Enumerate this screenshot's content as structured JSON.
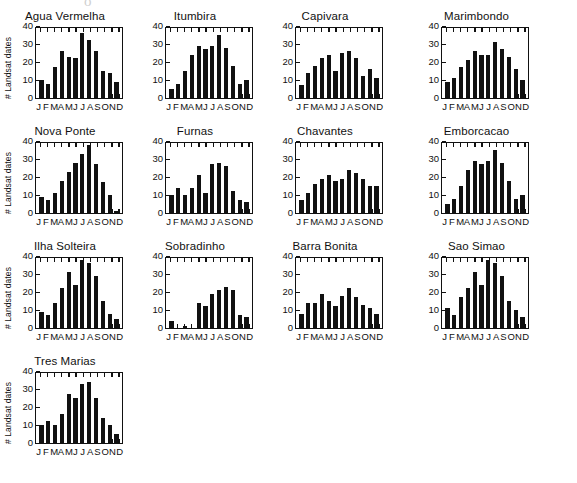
{
  "figure": {
    "ghost_glyph": "o",
    "ylabel": "# Landsat dates",
    "months": [
      "J",
      "F",
      "M",
      "A",
      "M",
      "J",
      "J",
      "A",
      "S",
      "O",
      "N",
      "D"
    ],
    "yticks": [
      0,
      10,
      20,
      30,
      40
    ]
  },
  "chart_data": {
    "type": "bar",
    "title": "",
    "xlabel": "",
    "ylabel": "# Landsat dates",
    "ylim": [
      0,
      40
    ],
    "grid": false,
    "legend": "none",
    "layout": "small-multiples, 4 columns x 4 rows (13 panels)",
    "categories": [
      "J",
      "F",
      "M",
      "A",
      "M",
      "J",
      "J",
      "A",
      "S",
      "O",
      "N",
      "D"
    ],
    "tick_labels_y": [
      "0",
      "10",
      "20",
      "30",
      "40"
    ],
    "panels": [
      {
        "title": "Agua Vermelha",
        "values": [
          10,
          8,
          17,
          26,
          23,
          22,
          36,
          32,
          26,
          15,
          14,
          9
        ]
      },
      {
        "title": "Itumbira",
        "values": [
          5,
          8,
          15,
          24,
          29,
          27,
          29,
          35,
          28,
          18,
          8,
          10
        ]
      },
      {
        "title": "Capivara",
        "values": [
          7,
          14,
          18,
          22,
          24,
          15,
          25,
          26,
          22,
          12,
          16,
          11
        ]
      },
      {
        "title": "Marimbondo",
        "values": [
          9,
          11,
          17,
          21,
          26,
          24,
          24,
          31,
          27,
          23,
          16,
          10
        ]
      },
      {
        "title": "Nova Ponte",
        "values": [
          9,
          7,
          11,
          18,
          23,
          28,
          33,
          38,
          27,
          17,
          10,
          1
        ]
      },
      {
        "title": "Furnas",
        "values": [
          10,
          14,
          10,
          14,
          21,
          11,
          27,
          28,
          26,
          12,
          7,
          6
        ]
      },
      {
        "title": "Chavantes",
        "values": [
          7,
          11,
          16,
          19,
          21,
          18,
          19,
          24,
          22,
          19,
          15,
          15
        ]
      },
      {
        "title": "Emborcacao",
        "values": [
          5,
          8,
          15,
          24,
          29,
          27,
          29,
          35,
          28,
          18,
          8,
          10
        ]
      },
      {
        "title": "Ilha Solteira",
        "values": [
          9,
          7,
          14,
          22,
          31,
          24,
          38,
          36,
          29,
          15,
          8,
          5
        ]
      },
      {
        "title": "Sobradinho",
        "values": [
          4,
          0,
          1,
          0,
          14,
          12,
          19,
          21,
          23,
          21,
          7,
          6
        ]
      },
      {
        "title": "Barra Bonita",
        "values": [
          8,
          14,
          14,
          19,
          15,
          12,
          18,
          22,
          17,
          13,
          11,
          8
        ]
      },
      {
        "title": "Sao Simao",
        "values": [
          11,
          7,
          17,
          22,
          31,
          24,
          38,
          36,
          29,
          15,
          10,
          6
        ]
      },
      {
        "title": "Tres Marias",
        "values": [
          10,
          12,
          10,
          16,
          27,
          25,
          33,
          34,
          25,
          14,
          10,
          5
        ]
      }
    ]
  }
}
